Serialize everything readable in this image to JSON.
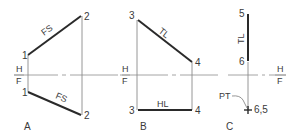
{
  "diagram": {
    "fold_line": {
      "top_label": "H",
      "bottom_label": "F"
    },
    "panels": [
      {
        "id": "A",
        "caption": "A",
        "points": {
          "top_1": "1",
          "top_2": "2",
          "bottom_1": "1",
          "bottom_2": "2"
        },
        "line_labels": {
          "top": "FS",
          "bottom": "FS"
        },
        "fold_label_top": "H",
        "fold_label_bottom": "F"
      },
      {
        "id": "B",
        "caption": "B",
        "points": {
          "top_3": "3",
          "top_4": "4",
          "bottom_3": "3",
          "bottom_4": "4"
        },
        "line_labels": {
          "top": "TL",
          "bottom": "HL"
        },
        "fold_label_top": "H",
        "fold_label_bottom": "F"
      },
      {
        "id": "C",
        "caption": "C",
        "points": {
          "top_5": "5",
          "top_6": "6",
          "bottom": "6,5"
        },
        "line_labels": {
          "top": "TL",
          "point_note": "PT"
        },
        "fold_label_top": "H",
        "fold_label_bottom": "F"
      }
    ],
    "colors": {
      "line": "#2a2a2a",
      "projector": "#8a8a8a",
      "text": "#3a3a3a",
      "background": "#ffffff"
    }
  }
}
